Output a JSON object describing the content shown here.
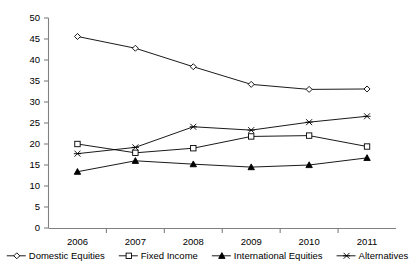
{
  "chart_data": {
    "type": "line",
    "title": "",
    "xlabel": "",
    "ylabel": "",
    "categories": [
      "2006",
      "2007",
      "2008",
      "2009",
      "2010",
      "2011"
    ],
    "x": [
      2006,
      2007,
      2008,
      2009,
      2010,
      2011
    ],
    "ylim": [
      0,
      50
    ],
    "y_ticks": [
      0,
      5,
      10,
      15,
      20,
      25,
      30,
      35,
      40,
      45,
      50
    ],
    "y_tick_labels": [
      "0",
      "5",
      "10",
      "15",
      "20",
      "25",
      "30",
      "35",
      "40",
      "45",
      "50"
    ],
    "grid": false,
    "legend_position": "bottom",
    "series": [
      {
        "name": "Domestic Equities",
        "marker": "open-diamond",
        "values": [
          45.6,
          42.8,
          38.4,
          34.2,
          33.0,
          33.1
        ]
      },
      {
        "name": "Fixed Income",
        "marker": "open-square",
        "values": [
          20.0,
          17.9,
          19.0,
          21.8,
          22.0,
          19.4
        ]
      },
      {
        "name": "International Equities",
        "marker": "filled-triangle",
        "values": [
          13.4,
          16.0,
          15.2,
          14.5,
          15.0,
          16.7
        ]
      },
      {
        "name": "Alternatives",
        "marker": "cross-star",
        "values": [
          17.7,
          19.2,
          24.1,
          23.3,
          25.2,
          26.6
        ]
      }
    ]
  },
  "axes": {
    "y_axis_name": "value-axis",
    "x_axis_name": "year-axis"
  },
  "legend": {
    "items": [
      {
        "label": "Domestic Equities",
        "marker": "open-diamond"
      },
      {
        "label": "Fixed Income",
        "marker": "open-square"
      },
      {
        "label": "International Equities",
        "marker": "filled-triangle"
      },
      {
        "label": "Alternatives",
        "marker": "cross-star"
      }
    ]
  }
}
